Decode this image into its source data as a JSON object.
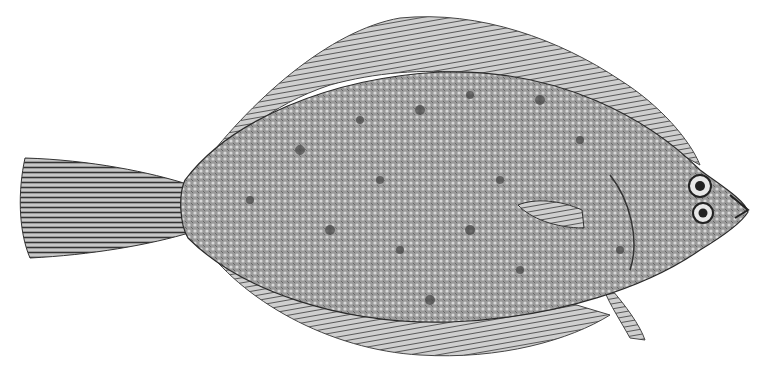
{
  "image": {
    "subject": "flatfish engraving",
    "description": "Black-and-white illustration of a flounder/plaice-like flatfish viewed from the side, head facing right, with fringed dorsal and anal fins and a fan-shaped tail on the left.",
    "colors": {
      "background": "#ffffff",
      "body": "#8a8a8a",
      "body_dark": "#4a4a4a",
      "fin": "#6a6a6a",
      "ink": "#1e1e1e"
    }
  }
}
